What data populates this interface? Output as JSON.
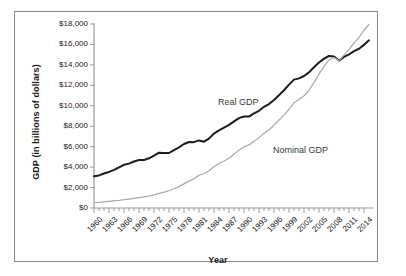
{
  "chart_data": {
    "type": "line",
    "title": "",
    "xlabel": "Year",
    "ylabel": "GDP (in billions of dollars)",
    "xlim": [
      1960,
      2015
    ],
    "ylim": [
      0,
      18000
    ],
    "ytick_labels": [
      "$0",
      "$2,000",
      "$4,000",
      "$6,000",
      "$8,000",
      "$10,000",
      "$12,000",
      "$14,000",
      "$16,000",
      "$18,000"
    ],
    "ytick_values": [
      0,
      2000,
      4000,
      6000,
      8000,
      10000,
      12000,
      14000,
      16000,
      18000
    ],
    "xtick_labels": [
      "1960",
      "1963",
      "1966",
      "1969",
      "1972",
      "1975",
      "1978",
      "1981",
      "1984",
      "1987",
      "1990",
      "1993",
      "1996",
      "1999",
      "2002",
      "2005",
      "2008",
      "2011",
      "2014"
    ],
    "xtick_values": [
      1960,
      1963,
      1966,
      1969,
      1972,
      1975,
      1978,
      1981,
      1984,
      1987,
      1990,
      1993,
      1996,
      1999,
      2002,
      2005,
      2008,
      2011,
      2014
    ],
    "grid": false,
    "legend_position": "inline-annotation",
    "annotations": [
      {
        "text": "Real GDP",
        "x": 1990,
        "y": 10300
      },
      {
        "text": "Nominal GDP",
        "x": 2001,
        "y": 5600
      }
    ],
    "x": [
      1960,
      1961,
      1962,
      1963,
      1964,
      1965,
      1966,
      1967,
      1968,
      1969,
      1970,
      1971,
      1972,
      1973,
      1974,
      1975,
      1976,
      1977,
      1978,
      1979,
      1980,
      1981,
      1982,
      1983,
      1984,
      1985,
      1986,
      1987,
      1988,
      1989,
      1990,
      1991,
      1992,
      1993,
      1994,
      1995,
      1996,
      1997,
      1998,
      1999,
      2000,
      2001,
      2002,
      2003,
      2004,
      2005,
      2006,
      2007,
      2008,
      2009,
      2010,
      2011,
      2012,
      2013,
      2014,
      2015
    ],
    "series": [
      {
        "name": "Real GDP",
        "color": "#1c1c1c",
        "width": 2.0,
        "values": [
          3110,
          3190,
          3380,
          3530,
          3730,
          3970,
          4230,
          4340,
          4550,
          4690,
          4700,
          4860,
          5120,
          5410,
          5390,
          5380,
          5670,
          5930,
          6260,
          6460,
          6440,
          6610,
          6490,
          6790,
          7280,
          7590,
          7860,
          8130,
          8470,
          8790,
          8950,
          8940,
          9250,
          9510,
          9900,
          10170,
          10560,
          11030,
          11520,
          12070,
          12560,
          12680,
          12910,
          13270,
          13770,
          14230,
          14610,
          14870,
          14830,
          14420,
          14780,
          15020,
          15350,
          15580,
          15960,
          16400
        ]
      },
      {
        "name": "Nominal GDP",
        "color": "#a8a8a8",
        "width": 1.2,
        "values": [
          540,
          560,
          600,
          640,
          690,
          740,
          810,
          860,
          940,
          1020,
          1080,
          1170,
          1280,
          1430,
          1550,
          1690,
          1880,
          2090,
          2360,
          2630,
          2860,
          3210,
          3350,
          3640,
          4040,
          4350,
          4590,
          4870,
          5250,
          5660,
          5980,
          6170,
          6540,
          6880,
          7310,
          7660,
          8100,
          8610,
          9090,
          9660,
          10290,
          10620,
          10980,
          11510,
          12270,
          13090,
          13860,
          14480,
          14720,
          14420,
          14960,
          15520,
          16160,
          16690,
          17390,
          17950
        ]
      }
    ]
  }
}
